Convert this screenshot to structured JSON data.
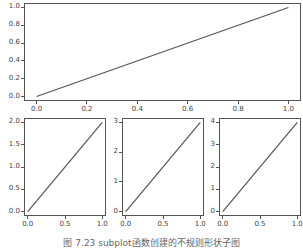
{
  "chart_data": [
    {
      "type": "line",
      "position": "top (spans full width)",
      "x": [
        0.0,
        1.0
      ],
      "series": [
        {
          "name": "line",
          "values": [
            0.0,
            1.0
          ],
          "color": "#555555"
        }
      ],
      "xticks": [
        "0.0",
        "0.2",
        "0.4",
        "0.6",
        "0.8",
        "1.0"
      ],
      "yticks": [
        "0.0",
        "0.2",
        "0.4",
        "0.6",
        "0.8",
        "1.0"
      ],
      "xlim": [
        -0.05,
        1.05
      ],
      "ylim": [
        -0.05,
        1.05
      ],
      "title": "",
      "xlabel": "",
      "ylabel": "",
      "grid": false
    },
    {
      "type": "line",
      "position": "bottom-left",
      "x": [
        0.0,
        1.0
      ],
      "series": [
        {
          "name": "line",
          "values": [
            0.0,
            2.0
          ],
          "color": "#555555"
        }
      ],
      "xticks": [
        "0.0",
        "0.5",
        "1.0"
      ],
      "yticks": [
        "0.0",
        "0.5",
        "1.0",
        "1.5",
        "2.0"
      ],
      "xlim": [
        -0.05,
        1.05
      ],
      "ylim": [
        -0.1,
        2.1
      ],
      "title": "",
      "xlabel": "",
      "ylabel": "",
      "grid": false
    },
    {
      "type": "line",
      "position": "bottom-middle",
      "x": [
        0.0,
        1.0
      ],
      "series": [
        {
          "name": "line",
          "values": [
            0,
            3
          ],
          "color": "#555555"
        }
      ],
      "xticks": [
        "0.0",
        "0.5",
        "1.0"
      ],
      "yticks": [
        "0",
        "1",
        "2",
        "3"
      ],
      "xlim": [
        -0.05,
        1.05
      ],
      "ylim": [
        -0.15,
        3.15
      ],
      "title": "",
      "xlabel": "",
      "ylabel": "",
      "grid": false
    },
    {
      "type": "line",
      "position": "bottom-right",
      "x": [
        0.0,
        1.0
      ],
      "series": [
        {
          "name": "line",
          "values": [
            0,
            4
          ],
          "color": "#555555"
        }
      ],
      "xticks": [
        "0.0",
        "0.5",
        "1.0"
      ],
      "yticks": [
        "0",
        "1",
        "2",
        "3",
        "4"
      ],
      "xlim": [
        -0.05,
        1.05
      ],
      "ylim": [
        -0.2,
        4.2
      ],
      "title": "",
      "xlabel": "",
      "ylabel": "",
      "grid": false
    }
  ],
  "caption": "图 7.23    subplot函数创建的不规则形状子图"
}
